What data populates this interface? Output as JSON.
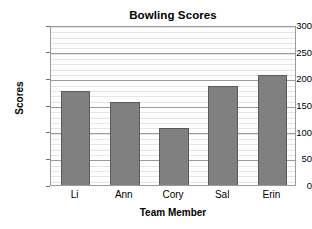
{
  "chart_data": {
    "type": "bar",
    "title": "Bowling Scores",
    "xlabel": "Team Member",
    "ylabel": "Scores",
    "categories": [
      "Li",
      "Ann",
      "Cory",
      "Sal",
      "Erin"
    ],
    "values": [
      180,
      160,
      110,
      190,
      210
    ],
    "ylim": [
      0,
      300
    ],
    "ytick_labels": [
      "0",
      "50",
      "100",
      "150",
      "200",
      "250",
      "300"
    ],
    "ytick_values": [
      0,
      50,
      100,
      150,
      200,
      250,
      300
    ],
    "y_major_step": 50,
    "y_minor_step": 10,
    "grid": "horizontal-major-and-minor",
    "legend": "none",
    "bar_color": "#808080",
    "bar_border_color": "#5a5a5a",
    "gridline_color": "#9a9a9a",
    "minor_gridline_color": "#d6cbcb",
    "axis_color": "#9a9a9a",
    "background_color": "#ffffff",
    "text_color": "#000000"
  }
}
